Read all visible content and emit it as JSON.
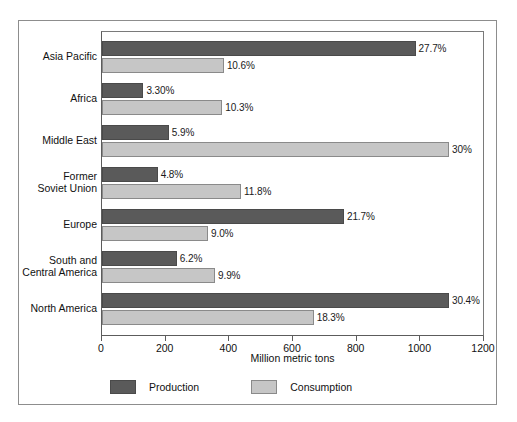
{
  "chart_data": {
    "type": "bar",
    "orientation": "horizontal",
    "title": "",
    "xlabel": "Million metric tons",
    "ylabel": "",
    "xlim": [
      0,
      1200
    ],
    "xticks": [
      0,
      200,
      400,
      600,
      800,
      1000,
      1200
    ],
    "xtick_labels": [
      "0",
      "200",
      "400",
      "600",
      "800",
      "1000",
      "1200"
    ],
    "grid": false,
    "legend_position": "bottom-left",
    "categories": [
      "Asia Pacific",
      "Africa",
      "Middle East",
      "Former Soviet Union",
      "Europe",
      "South and Central America",
      "North America"
    ],
    "series": [
      {
        "name": "Production",
        "color": "#5a5a5a",
        "values": [
          985,
          130,
          210,
          175,
          760,
          235,
          1090
        ],
        "labels": [
          "27.7%",
          "3.30%",
          "5.9%",
          "4.8%",
          "21.7%",
          "6.2%",
          "30.4%"
        ]
      },
      {
        "name": "Consumption",
        "color": "#c6c6c6",
        "values": [
          383,
          378,
          1090,
          437,
          333,
          355,
          665
        ],
        "labels": [
          "10.6%",
          "10.3%",
          "30%",
          "11.8%",
          "9.0%",
          "9.9%",
          "18.3%"
        ]
      }
    ]
  },
  "categories_display": [
    [
      "Asia Pacific"
    ],
    [
      "Africa"
    ],
    [
      "Middle East"
    ],
    [
      "Former",
      "Soviet Union"
    ],
    [
      "Europe"
    ],
    [
      "South and",
      "Central America"
    ],
    [
      "North America"
    ]
  ],
  "legend": {
    "items": [
      {
        "label": "Production",
        "color": "#5a5a5a"
      },
      {
        "label": "Consumption",
        "color": "#c6c6c6"
      }
    ]
  },
  "axis": {
    "x_title": "Million metric tons",
    "tick_labels": [
      "0",
      "200",
      "400",
      "600",
      "800",
      "1000",
      "1200"
    ]
  },
  "colors": {
    "production": "#5a5a5a",
    "consumption": "#c6c6c6",
    "frame": "#8d8d8d",
    "axis": "#5c5c5c",
    "text": "#111111",
    "background": "#ffffff"
  }
}
